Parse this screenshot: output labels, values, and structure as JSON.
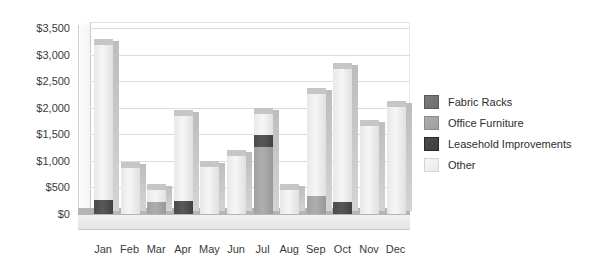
{
  "chart_data": {
    "type": "bar",
    "subtype": "stacked-column-3d",
    "title": "",
    "xlabel": "",
    "ylabel": "",
    "categories": [
      "Jan",
      "Feb",
      "Mar",
      "Apr",
      "May",
      "Jun",
      "Jul",
      "Aug",
      "Sep",
      "Oct",
      "Nov",
      "Dec"
    ],
    "series": [
      {
        "name": "Fabric Racks",
        "color": "#6f6f6f",
        "values": [
          0,
          0,
          0,
          0,
          0,
          0,
          0,
          0,
          0,
          0,
          0,
          0
        ]
      },
      {
        "name": "Office Furniture",
        "color": "#a0a0a0",
        "values": [
          0,
          0,
          230,
          0,
          0,
          0,
          1260,
          0,
          330,
          0,
          0,
          0
        ]
      },
      {
        "name": "Leasehold Improvements",
        "color": "#4a4a4a",
        "values": [
          270,
          0,
          0,
          250,
          0,
          0,
          230,
          0,
          0,
          220,
          0,
          0
        ]
      },
      {
        "name": "Other",
        "color": "#e8e8e8",
        "values": [
          2930,
          880,
          250,
          1620,
          900,
          1110,
          420,
          480,
          1950,
          2530,
          1670,
          2030
        ]
      }
    ],
    "totals": [
      3200,
      880,
      480,
      1870,
      900,
      1110,
      1910,
      480,
      2280,
      2750,
      1670,
      2030
    ],
    "ylim": [
      0,
      3500
    ],
    "yticks": [
      0,
      500,
      1000,
      1500,
      2000,
      2500,
      3000,
      3500
    ],
    "ytick_labels": [
      "$0",
      "$500",
      "$1,000",
      "$1,500",
      "$2,000",
      "$2,500",
      "$3,000",
      "$3,500"
    ],
    "grid": true,
    "legend_position": "right"
  },
  "legend": {
    "items": [
      {
        "label": "Fabric Racks",
        "color": "#6f6f6f"
      },
      {
        "label": "Office Furniture",
        "color": "#a0a0a0"
      },
      {
        "label": "Leasehold Improvements",
        "color": "#3f3f3f"
      },
      {
        "label": "Other",
        "color": "#eaeaea"
      }
    ]
  }
}
